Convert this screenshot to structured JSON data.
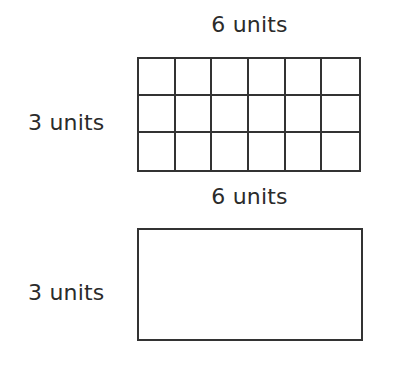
{
  "figure": {
    "title": "",
    "background_color": "#ffffff",
    "line_color": "#333333",
    "text_color": "#2b2b2b"
  },
  "top_figure": {
    "name": "partitioned-grid-rectangle",
    "top_label": "6 units",
    "side_label": "3 units",
    "columns": 6,
    "rows": 3,
    "total_cells": 18
  },
  "bottom_figure": {
    "name": "plain-rectangle",
    "top_label": "6 units",
    "side_label": "3 units",
    "columns": 1,
    "rows": 1
  },
  "chart_data": {
    "type": "table",
    "title": "",
    "xlabel": "",
    "ylabel": "",
    "shapes": [
      {
        "id": "grid-figure",
        "shape": "rectangle",
        "partitioned": true,
        "width_units": 6,
        "height_units": 3,
        "unit_squares": 18,
        "width_label": "6 units",
        "height_label": "3 units"
      },
      {
        "id": "rect-figure",
        "shape": "rectangle",
        "partitioned": false,
        "width_units": 6,
        "height_units": 3,
        "unit_squares": 18,
        "width_label": "6 units",
        "height_label": "3 units"
      }
    ]
  }
}
